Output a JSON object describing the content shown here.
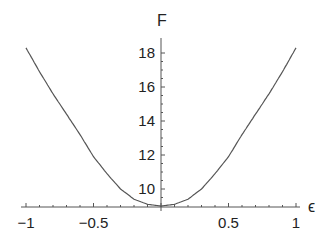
{
  "chart_data": {
    "type": "line",
    "title": "",
    "xlabel": "ϵ",
    "ylabel": "F",
    "xlim": [
      -1,
      1
    ],
    "ylim": [
      9,
      18.4
    ],
    "x_origin_y_value": 9,
    "grid": false,
    "legend": null,
    "xticks": [
      -1,
      -0.5,
      0.5,
      1
    ],
    "xtick_labels": [
      "−1",
      "−0.5",
      "0.5",
      "1"
    ],
    "yticks": [
      10,
      12,
      14,
      16,
      18
    ],
    "ytick_labels": [
      "10",
      "12",
      "14",
      "16",
      "18"
    ],
    "series": [
      {
        "name": "F(ϵ)",
        "color": "#555555",
        "x": [
          -1,
          -0.9,
          -0.8,
          -0.7,
          -0.6,
          -0.5,
          -0.4,
          -0.3,
          -0.2,
          -0.1,
          0,
          0.1,
          0.2,
          0.3,
          0.4,
          0.5,
          0.6,
          0.7,
          0.8,
          0.9,
          1
        ],
        "y": [
          18.3,
          16.9,
          15.6,
          14.4,
          13.2,
          11.9,
          10.9,
          10.0,
          9.4,
          9.1,
          9.0,
          9.1,
          9.4,
          10.0,
          10.9,
          11.9,
          13.2,
          14.4,
          15.6,
          16.9,
          18.3
        ]
      }
    ]
  }
}
